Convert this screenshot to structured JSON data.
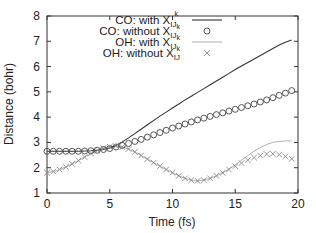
{
  "chart_data": {
    "type": "line",
    "title": "",
    "xlabel": "Time (fs)",
    "ylabel": "Distance (bohr)",
    "xlim": [
      0,
      20
    ],
    "ylim": [
      1,
      8
    ],
    "xticks": [
      "0",
      "5",
      "10",
      "15",
      "20"
    ],
    "yticks": [
      "1",
      "2",
      "3",
      "4",
      "5",
      "6",
      "7",
      "8"
    ],
    "grid": false,
    "legend_position": "top-center-inside",
    "x": [
      0,
      0.5,
      1,
      1.5,
      2,
      2.5,
      3,
      3.5,
      4,
      4.5,
      5,
      5.5,
      6,
      6.5,
      7,
      7.5,
      8,
      8.5,
      9,
      9.5,
      10,
      10.5,
      11,
      11.5,
      12,
      12.5,
      13,
      13.5,
      14,
      14.5,
      15,
      15.5,
      16,
      16.5,
      17,
      17.5,
      18,
      18.5,
      19,
      19.5
    ],
    "series": [
      {
        "name": "CO: with X_IJk^k",
        "style": "solid dark line",
        "color": "#333333",
        "values": [
          2.65,
          2.65,
          2.65,
          2.65,
          2.65,
          2.65,
          2.66,
          2.67,
          2.69,
          2.72,
          2.78,
          2.88,
          3.02,
          3.18,
          3.35,
          3.52,
          3.7,
          3.87,
          4.04,
          4.2,
          4.36,
          4.52,
          4.68,
          4.83,
          4.98,
          5.13,
          5.28,
          5.43,
          5.58,
          5.73,
          5.88,
          6.02,
          6.16,
          6.3,
          6.44,
          6.58,
          6.72,
          6.85,
          6.96,
          7.05
        ]
      },
      {
        "name": "CO: without X_IJk",
        "style": "circle markers",
        "color": "#333333",
        "values": [
          2.65,
          2.65,
          2.65,
          2.65,
          2.65,
          2.65,
          2.66,
          2.67,
          2.69,
          2.72,
          2.76,
          2.82,
          2.88,
          2.96,
          3.04,
          3.12,
          3.21,
          3.3,
          3.39,
          3.48,
          3.57,
          3.65,
          3.73,
          3.81,
          3.89,
          3.96,
          4.03,
          4.1,
          4.17,
          4.24,
          4.31,
          4.38,
          4.45,
          4.52,
          4.6,
          4.68,
          4.77,
          4.86,
          4.95,
          5.05
        ]
      },
      {
        "name": "OH: with X_IJk",
        "style": "solid light gray line",
        "color": "#aaaaaa",
        "values": [
          1.8,
          1.85,
          1.93,
          2.03,
          2.15,
          2.28,
          2.42,
          2.56,
          2.68,
          2.77,
          2.83,
          2.85,
          2.82,
          2.74,
          2.62,
          2.48,
          2.34,
          2.2,
          2.06,
          1.93,
          1.8,
          1.68,
          1.58,
          1.51,
          1.48,
          1.51,
          1.58,
          1.68,
          1.8,
          1.95,
          2.12,
          2.3,
          2.48,
          2.65,
          2.8,
          2.92,
          3.0,
          3.04,
          3.06,
          3.06
        ]
      },
      {
        "name": "OH: without X_IJ",
        "style": "x markers",
        "color": "#888888",
        "values": [
          1.8,
          1.85,
          1.93,
          2.03,
          2.15,
          2.28,
          2.42,
          2.56,
          2.68,
          2.77,
          2.83,
          2.85,
          2.82,
          2.74,
          2.62,
          2.48,
          2.34,
          2.2,
          2.06,
          1.93,
          1.8,
          1.68,
          1.58,
          1.51,
          1.48,
          1.51,
          1.58,
          1.68,
          1.8,
          1.93,
          2.06,
          2.18,
          2.3,
          2.4,
          2.48,
          2.54,
          2.55,
          2.52,
          2.45,
          2.35
        ]
      }
    ]
  },
  "legend": {
    "items": [
      {
        "prefix": "CO: with X",
        "sub": "IJ",
        "subsub": "k",
        "sup": "k",
        "marker": "line-dark"
      },
      {
        "prefix": "CO: without X",
        "sub": "IJ",
        "subsub": "k",
        "sup": "",
        "marker": "circle"
      },
      {
        "prefix": "OH: with X",
        "sub": "IJ",
        "subsub": "k",
        "sup": "",
        "marker": "line-light"
      },
      {
        "prefix": "OH: without X",
        "sub": "IJ",
        "subsub": "",
        "sup": "",
        "marker": "cross"
      }
    ]
  }
}
